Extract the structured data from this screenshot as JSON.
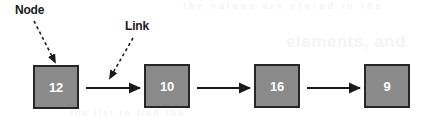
{
  "figure": {
    "background_color": "#ffffff",
    "node_fill_color": "#8a8a8a",
    "node_border_color": "#262626",
    "node_text_color": "#ffffff",
    "label_text_color": "#1a1a1a",
    "arrow_color": "#1a1a1a"
  },
  "callouts": [
    {
      "id": "node",
      "label": "Node",
      "x": 15,
      "y": 3,
      "arrow": {
        "from_x": 34,
        "from_y": 21,
        "to_x": 55,
        "to_y": 62,
        "style": "dashed"
      }
    },
    {
      "id": "link",
      "label": "Link",
      "x": 125,
      "y": 19,
      "arrow": {
        "from_x": 133,
        "from_y": 38,
        "to_x": 110,
        "to_y": 78,
        "style": "dashed"
      }
    }
  ],
  "nodes": [
    {
      "value": "12",
      "x": 33,
      "y": 65,
      "width": 46,
      "height": 44
    },
    {
      "value": "10",
      "x": 144,
      "y": 64,
      "width": 46,
      "height": 44
    },
    {
      "value": "16",
      "x": 254,
      "y": 64,
      "width": 46,
      "height": 44
    },
    {
      "value": "9",
      "x": 364,
      "y": 64,
      "width": 46,
      "height": 44
    }
  ],
  "links": [
    {
      "from": "12",
      "to": "10",
      "x1": 86,
      "y1": 88,
      "x2": 140,
      "y2": 88
    },
    {
      "from": "10",
      "to": "16",
      "x1": 197,
      "y1": 88,
      "x2": 250,
      "y2": 88
    },
    {
      "from": "16",
      "to": "9",
      "x1": 307,
      "y1": 88,
      "x2": 360,
      "y2": 88
    }
  ],
  "ghost_text": {
    "top": "the values are stored in the",
    "heading": "elements, and",
    "bottom": "the list to find the"
  }
}
